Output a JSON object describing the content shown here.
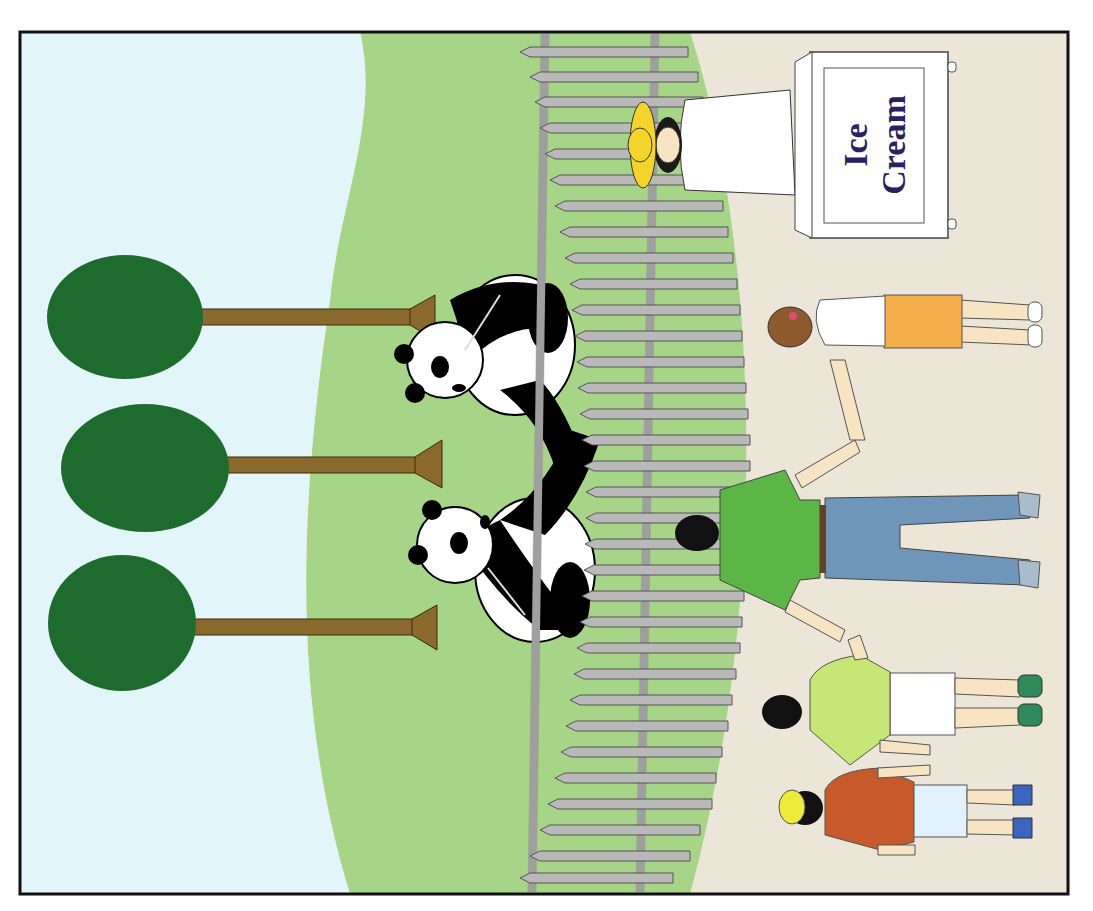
{
  "scene": {
    "title": "Zoo panda enclosure illustration (rotated 90°)",
    "orientation": "rotated-90-clockwise",
    "colors": {
      "sky": "#e2f5f8",
      "grass": "#a6d587",
      "path": "#ece6d8",
      "frame": "#111111",
      "tree_foliage": "#1e6b2e",
      "tree_trunk": "#8a6a2c",
      "fence": "#b9b9b9",
      "sign_text": "#2a2160",
      "hat": "#f2d42a",
      "girl_skirt": "#f3ae4a",
      "man_shirt": "#5cb646",
      "man_jeans": "#6f96b8",
      "boy_shirt": "#c6e676",
      "kid_shirt": "#c65a2a",
      "kid_cap": "#eeea3a",
      "kid_shoes": "#3a64c0",
      "boy_shoes": "#2e8a5a"
    }
  },
  "sign": {
    "line1": "Ice",
    "line2": "Cream"
  },
  "elements": {
    "trees": [
      {
        "label": "tree-1"
      },
      {
        "label": "tree-2"
      },
      {
        "label": "tree-3"
      }
    ],
    "pandas": [
      {
        "label": "panda-upper"
      },
      {
        "label": "panda-lower"
      }
    ],
    "people": [
      {
        "label": "ice-cream-vendor"
      },
      {
        "label": "girl-orange-skirt"
      },
      {
        "label": "man-green-shirt"
      },
      {
        "label": "boy-light-green-shirt"
      },
      {
        "label": "kid-yellow-cap"
      }
    ]
  }
}
